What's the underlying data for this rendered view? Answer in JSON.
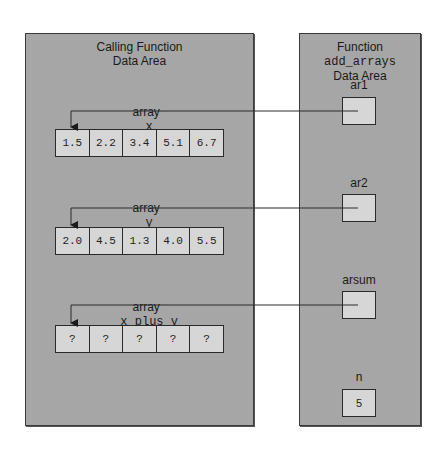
{
  "calling_panel": {
    "title_line1": "Calling Function",
    "title_line2": "Data Area",
    "arrays": [
      {
        "label_prefix": "array",
        "name": "x",
        "values": [
          "1.5",
          "2.2",
          "3.4",
          "5.1",
          "6.7"
        ]
      },
      {
        "label_prefix": "array",
        "name": "y",
        "values": [
          "2.0",
          "4.5",
          "1.3",
          "4.0",
          "5.5"
        ]
      },
      {
        "label_prefix": "array",
        "name": "x_plus_y",
        "values": [
          "?",
          "?",
          "?",
          "?",
          "?"
        ]
      }
    ]
  },
  "callee_panel": {
    "title_prefix": "Function",
    "function_name": "add_arrays",
    "title_line2": "Data Area",
    "params": [
      {
        "name": "ar1",
        "value": ""
      },
      {
        "name": "ar2",
        "value": ""
      },
      {
        "name": "arsum",
        "value": ""
      },
      {
        "name": "n",
        "value": "5"
      }
    ]
  },
  "colors": {
    "panel_bg": "#a6a6a6",
    "cell_bg": "#d6d6d6",
    "line": "#2a2a2a"
  }
}
